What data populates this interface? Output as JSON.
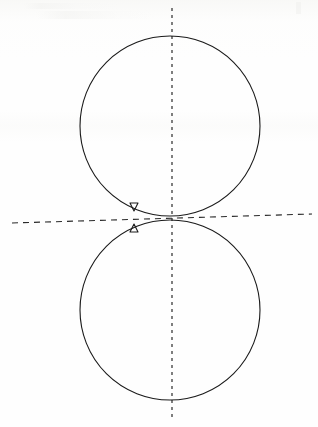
{
  "figure": {
    "caption": "",
    "background_color": "#fefefe",
    "stroke_color": "#1a1a1a",
    "dash_color": "#2a2a2a",
    "canvas": {
      "width": 318,
      "height": 427
    }
  },
  "chart_data": {
    "type": "line",
    "xlabel": "",
    "ylabel": "",
    "xlim": [
      0,
      318
    ],
    "ylim": [
      0,
      427
    ],
    "grid": false,
    "legend": "none",
    "coordinate_system": "image pixels, y increases downward",
    "series": [
      {
        "name": "upper-circle",
        "shape": "circle",
        "center": [
          170,
          126
        ],
        "radius": 90,
        "bbox": [
          80,
          36,
          260,
          216
        ],
        "stroke": "#1a1a1a",
        "stroke_width": 1.1,
        "style": "solid"
      },
      {
        "name": "lower-circle",
        "shape": "circle",
        "center": [
          170,
          310
        ],
        "radius": 90,
        "bbox": [
          80,
          220,
          260,
          400
        ],
        "stroke": "#1a1a1a",
        "stroke_width": 1.1,
        "style": "solid"
      }
    ],
    "axes_lines": [
      {
        "name": "vertical-axis",
        "orientation": "vertical",
        "from": [
          172,
          8
        ],
        "to": [
          172,
          421
        ],
        "style": "dashed",
        "dash_pattern": "3 4",
        "stroke": "#2a2a2a",
        "stroke_width": 1.2
      },
      {
        "name": "horizontal-axis",
        "orientation": "horizontal",
        "from": [
          12,
          223
        ],
        "to": [
          312,
          214
        ],
        "style": "dashed",
        "dash_pattern": "6 5",
        "stroke": "#2a2a2a",
        "stroke_width": 1.1,
        "note": "slightly tilted, rises left-to-right"
      }
    ],
    "annotations": [
      {
        "name": "marker-down-triangle",
        "glyph": "open-down-triangle",
        "position": [
          134,
          207
        ],
        "size": 8,
        "filled": false,
        "stroke": "#1a1a1a"
      },
      {
        "name": "marker-up-triangle",
        "glyph": "open-up-triangle",
        "position": [
          134,
          228
        ],
        "size": 8,
        "filled": false,
        "stroke": "#1a1a1a"
      }
    ],
    "intersection": {
      "name": "cusp-crossing",
      "position": [
        190,
        218
      ],
      "description": "upper and lower circle arcs cross forming an X / cusp just right of the vertical axis"
    }
  }
}
